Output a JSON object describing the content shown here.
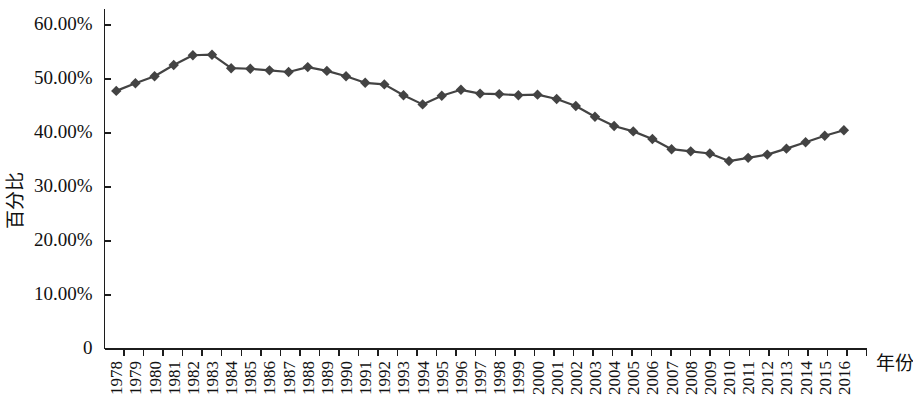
{
  "chart_data": {
    "type": "line",
    "title": "",
    "subtitle": "",
    "xlabel": "年份",
    "ylabel": "百分比",
    "xlim": [
      1977.5,
      2016.5
    ],
    "ylim": [
      0,
      60
    ],
    "grid": false,
    "legend": null,
    "legend_position": "none",
    "marker": "diamond",
    "series_color": "#434343",
    "categories": [
      "1978",
      "1979",
      "1980",
      "1981",
      "1982",
      "1983",
      "1984",
      "1985",
      "1986",
      "1987",
      "1988",
      "1989",
      "1990",
      "1991",
      "1992",
      "1993",
      "1994",
      "1995",
      "1996",
      "1997",
      "1998",
      "1999",
      "2000",
      "2001",
      "2002",
      "2003",
      "2004",
      "2005",
      "2006",
      "2007",
      "2008",
      "2009",
      "2010",
      "2011",
      "2012",
      "2013",
      "2014",
      "2015",
      "2016"
    ],
    "values": [
      47.8,
      49.2,
      50.5,
      52.6,
      54.4,
      54.5,
      52.0,
      51.9,
      51.6,
      51.3,
      52.2,
      51.5,
      50.5,
      49.3,
      49.0,
      47.0,
      45.3,
      46.9,
      48.0,
      47.3,
      47.2,
      47.0,
      47.1,
      46.3,
      45.0,
      43.0,
      41.3,
      40.3,
      38.9,
      37.0,
      36.6,
      36.2,
      34.8,
      35.4,
      36.0,
      37.1,
      38.3,
      39.5,
      40.5
    ],
    "y_ticks": [
      {
        "value": 60,
        "label": "60.00%"
      },
      {
        "value": 50,
        "label": "50.00%"
      },
      {
        "value": 40,
        "label": "40.00%"
      },
      {
        "value": 30,
        "label": "30.00%"
      },
      {
        "value": 20,
        "label": "20.00%"
      },
      {
        "value": 10,
        "label": "10.00%"
      },
      {
        "value": 0,
        "label": "0"
      }
    ]
  },
  "axes": {
    "y_axis_title": "百分比",
    "x_axis_title": "年份"
  },
  "colors": {
    "series": "#434343",
    "axis": "#1c1c1c",
    "text": "#111111",
    "background": "#ffffff"
  }
}
